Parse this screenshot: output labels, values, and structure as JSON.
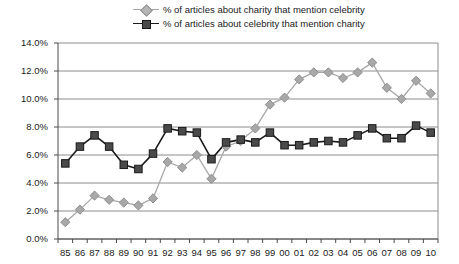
{
  "chart_data": {
    "type": "line",
    "title": "",
    "subtitle": "",
    "xlabel": "",
    "ylabel": "",
    "grid": true,
    "legend_position": "top",
    "categories": [
      "85",
      "86",
      "87",
      "88",
      "89",
      "90",
      "91",
      "92",
      "93",
      "94",
      "95",
      "96",
      "97",
      "98",
      "99",
      "00",
      "01",
      "02",
      "03",
      "04",
      "05",
      "06",
      "07",
      "08",
      "09",
      "10"
    ],
    "ylim": [
      0.0,
      14.0
    ],
    "ytick_labels": [
      "0.0%",
      "2.0%",
      "4.0%",
      "6.0%",
      "8.0%",
      "10.0%",
      "12.0%",
      "14.0%"
    ],
    "ytick_values": [
      0.0,
      2.0,
      4.0,
      6.0,
      8.0,
      10.0,
      12.0,
      14.0
    ],
    "series": [
      {
        "name": "% of articles about charity that mention celebrity",
        "marker": "diamond",
        "color": "#a8a8a8",
        "line_color": "#a8a8a8",
        "values": [
          1.2,
          2.1,
          3.1,
          2.8,
          2.6,
          2.4,
          2.9,
          5.5,
          5.1,
          6.0,
          4.3,
          6.6,
          7.0,
          7.9,
          9.6,
          10.1,
          11.4,
          11.9,
          11.9,
          11.5,
          11.9,
          12.6,
          10.8,
          10.0,
          11.3,
          10.4
        ]
      },
      {
        "name": "% of articles about celebrity that mention charity",
        "marker": "square",
        "color": "#4a4a4a",
        "line_color": "#1a1a1a",
        "values": [
          5.4,
          6.6,
          7.4,
          6.6,
          5.3,
          5.0,
          6.1,
          7.9,
          7.7,
          7.6,
          5.7,
          6.9,
          7.1,
          6.9,
          7.6,
          6.7,
          6.7,
          6.9,
          7.0,
          6.9,
          7.4,
          7.9,
          7.2,
          7.2,
          8.1,
          7.6
        ]
      }
    ]
  },
  "axis": {
    "plot_left": 58,
    "plot_right": 438,
    "plot_top": 43,
    "plot_bottom": 239
  },
  "colors": {
    "gridline": "#8c8c8c",
    "axis": "#4a4a4a",
    "series_light": "#a8a8a8",
    "series_dark": "#3c3c3c",
    "background": "#ffffff"
  }
}
